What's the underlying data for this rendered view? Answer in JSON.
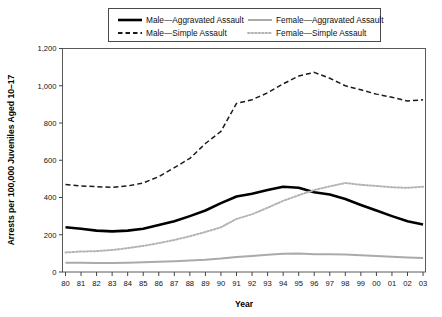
{
  "chart_data": {
    "type": "line",
    "title": "",
    "xlabel": "Year",
    "ylabel": "Arrests per 100,000 Juveniles Aged 10–17",
    "ylim": [
      0,
      1200
    ],
    "yticks": [
      "0",
      "200",
      "400",
      "600",
      "800",
      "1,000",
      "1,200"
    ],
    "ytick_values": [
      0,
      200,
      400,
      600,
      800,
      1000,
      1200
    ],
    "grid": false,
    "legend_position": "top-inside",
    "categories": [
      "80",
      "81",
      "82",
      "83",
      "84",
      "85",
      "86",
      "87",
      "88",
      "89",
      "90",
      "91",
      "92",
      "93",
      "94",
      "95",
      "96",
      "97",
      "98",
      "99",
      "00",
      "01",
      "02",
      "03"
    ],
    "series": [
      {
        "name": "Male—Aggravated Assault",
        "style": "solid",
        "color": "#000000",
        "width": 2.6,
        "values": [
          240,
          232,
          222,
          218,
          222,
          232,
          252,
          272,
          300,
          330,
          370,
          405,
          420,
          440,
          458,
          452,
          428,
          416,
          392,
          360,
          330,
          300,
          272,
          255
        ]
      },
      {
        "name": "Male—Simple Assault",
        "style": "dashed",
        "color": "#1a1a1a",
        "width": 1.5,
        "values": [
          470,
          462,
          458,
          455,
          462,
          478,
          512,
          560,
          610,
          690,
          755,
          905,
          925,
          962,
          1010,
          1052,
          1072,
          1040,
          1000,
          978,
          955,
          938,
          918,
          925
        ]
      },
      {
        "name": "Female—Aggravated Assault",
        "style": "solid",
        "color": "#aaaaaa",
        "width": 2.0,
        "values": [
          50,
          50,
          48,
          48,
          50,
          52,
          55,
          58,
          62,
          66,
          72,
          80,
          86,
          92,
          98,
          100,
          95,
          95,
          94,
          90,
          86,
          82,
          78,
          75
        ]
      },
      {
        "name": "Female—Simple Assault",
        "style": "dotted",
        "color": "#b4b4b4",
        "width": 2.0,
        "values": [
          105,
          110,
          112,
          118,
          128,
          140,
          155,
          172,
          192,
          215,
          240,
          285,
          310,
          345,
          382,
          412,
          440,
          460,
          478,
          468,
          462,
          455,
          452,
          458
        ]
      }
    ]
  },
  "legend": {
    "items": [
      {
        "label": "Male—Aggravated Assault",
        "style": "solid",
        "color": "#000000"
      },
      {
        "label": "Female—Aggravated Assault",
        "style": "solid",
        "color": "#aaaaaa"
      },
      {
        "label": "Male—Simple Assault",
        "style": "dashed",
        "color": "#1a1a1a"
      },
      {
        "label": "Female—Simple Assault",
        "style": "dotted",
        "color": "#b4b4b4"
      }
    ]
  },
  "axes": {
    "x_title": "Year",
    "y_title": "Arrests per 100,000 Juveniles Aged 10–17"
  }
}
